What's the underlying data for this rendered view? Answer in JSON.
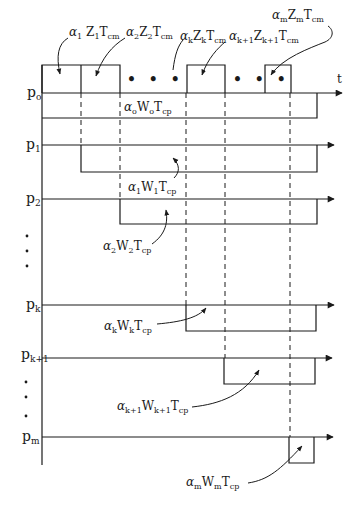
{
  "diagram": {
    "type": "timing-diagram",
    "time_axis_label": "t",
    "ellipsis": "• • •",
    "vertical_dots": "•",
    "colors": {
      "line": "#1a1a1a",
      "background": "#ffffff"
    },
    "processors": [
      {
        "id": "p0",
        "name": "p",
        "sub": "o"
      },
      {
        "id": "p1",
        "name": "p",
        "sub": "1"
      },
      {
        "id": "p2",
        "name": "p",
        "sub": "2"
      },
      {
        "id": "pk",
        "name": "p",
        "sub": "k"
      },
      {
        "id": "pk1",
        "name": "p",
        "sub": "k+1"
      },
      {
        "id": "pm",
        "name": "p",
        "sub": "m"
      }
    ],
    "communication_labels": [
      {
        "alpha": "α",
        "alpha_sub": "1",
        "var": "Z",
        "var_sub": "1",
        "tail": "T",
        "tail_sub": "cm"
      },
      {
        "alpha": "α",
        "alpha_sub": "2",
        "var": "Z",
        "var_sub": "2",
        "tail": "T",
        "tail_sub": "cm"
      },
      {
        "alpha": "α",
        "alpha_sub": "k",
        "var": "Z",
        "var_sub": "k",
        "tail": "T",
        "tail_sub": "cm"
      },
      {
        "alpha": "α",
        "alpha_sub": "k+1",
        "var": "Z",
        "var_sub": "k+1",
        "tail": "T",
        "tail_sub": "cm"
      },
      {
        "alpha": "α",
        "alpha_sub": "m",
        "var": "Z",
        "var_sub": "m",
        "tail": "T",
        "tail_sub": "cm"
      }
    ],
    "computation_labels": [
      {
        "alpha": "α",
        "alpha_sub": "o",
        "var": "W",
        "var_sub": "o",
        "tail": "T",
        "tail_sub": "cp"
      },
      {
        "alpha": "α",
        "alpha_sub": "1",
        "var": "W",
        "var_sub": "1",
        "tail": "T",
        "tail_sub": "cp"
      },
      {
        "alpha": "α",
        "alpha_sub": "2",
        "var": "W",
        "var_sub": "2",
        "tail": "T",
        "tail_sub": "cp"
      },
      {
        "alpha": "α",
        "alpha_sub": "k",
        "var": "W",
        "var_sub": "k",
        "tail": "T",
        "tail_sub": "cp"
      },
      {
        "alpha": "α",
        "alpha_sub": "k+1",
        "var": "W",
        "var_sub": "k+1",
        "tail": "T",
        "tail_sub": "cp"
      },
      {
        "alpha": "α",
        "alpha_sub": "m",
        "var": "W",
        "var_sub": "m",
        "tail": "T",
        "tail_sub": "cp"
      }
    ]
  }
}
